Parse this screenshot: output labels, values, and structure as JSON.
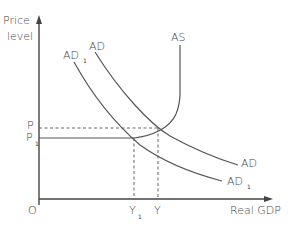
{
  "diagram": {
    "title": "",
    "y_axis_label_line1": "Price",
    "y_axis_label_line2": "level",
    "x_axis_label": "Real GDP",
    "origin_label": "O",
    "curves": {
      "as": {
        "label": "AS"
      },
      "ad": {
        "label": "AD",
        "top_label": "AD",
        "bottom_label": "AD"
      },
      "ad1": {
        "label": "AD",
        "subscript": "1"
      }
    },
    "price_levels": {
      "p": {
        "label": "P"
      },
      "p1": {
        "label": "P",
        "subscript": "1"
      }
    },
    "output_levels": {
      "y": {
        "label": "Y"
      },
      "y1": {
        "label": "Y",
        "subscript": "1"
      }
    },
    "colors": {
      "line": "#555555",
      "text": "#444444",
      "background": "#ffffff"
    }
  }
}
